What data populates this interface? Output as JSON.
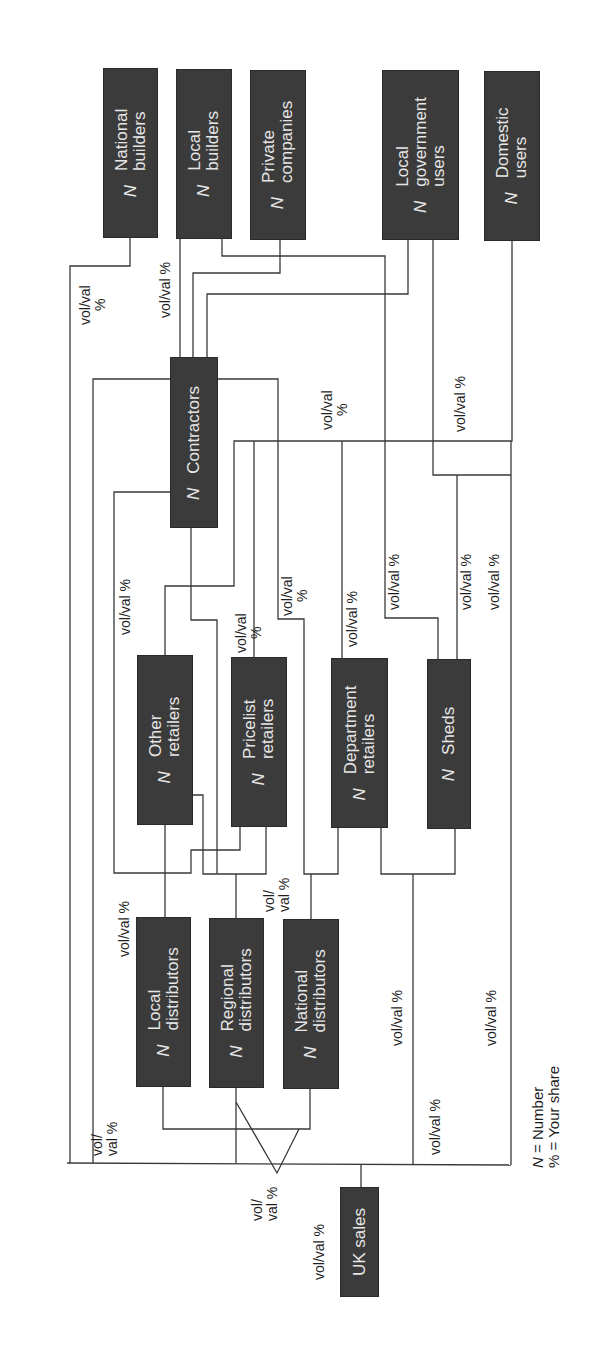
{
  "diagram": {
    "nodes": {
      "national_builders": {
        "n": "N",
        "lines": [
          "National",
          "builders"
        ]
      },
      "local_builders": {
        "n": "N",
        "lines": [
          "Local",
          "builders"
        ]
      },
      "private_companies": {
        "n": "N",
        "lines": [
          "Private",
          "companies"
        ]
      },
      "local_government_users": {
        "n": "N",
        "lines": [
          "Local",
          "government",
          "users"
        ]
      },
      "domestic_users": {
        "n": "N",
        "lines": [
          "Domestic",
          "users"
        ]
      },
      "contractors": {
        "n": "N",
        "lines": [
          "Contractors"
        ]
      },
      "other_retailers": {
        "n": "N",
        "lines": [
          "Other",
          "retailers"
        ]
      },
      "pricelist_retailers": {
        "n": "N",
        "lines": [
          "Pricelist",
          "retailers"
        ]
      },
      "department_retailers": {
        "n": "N",
        "lines": [
          "Department",
          "retailers"
        ]
      },
      "sheds": {
        "n": "N",
        "lines": [
          "Sheds"
        ]
      },
      "local_distributors": {
        "n": "N",
        "lines": [
          "Local",
          "distributors"
        ]
      },
      "regional_distributors": {
        "n": "N",
        "lines": [
          "Regional",
          "distributors"
        ]
      },
      "national_distributors": {
        "n": "N",
        "lines": [
          "National",
          "distributors"
        ]
      },
      "uk_sales": {
        "lines": [
          "UK sales"
        ]
      }
    },
    "flow_labels": {
      "two_line_a": [
        "vol/val",
        "%"
      ],
      "one_line": [
        "vol/val %"
      ],
      "split_a": [
        "vol/",
        "val %"
      ]
    },
    "legend": [
      "N = Number",
      "% = Your share"
    ]
  }
}
